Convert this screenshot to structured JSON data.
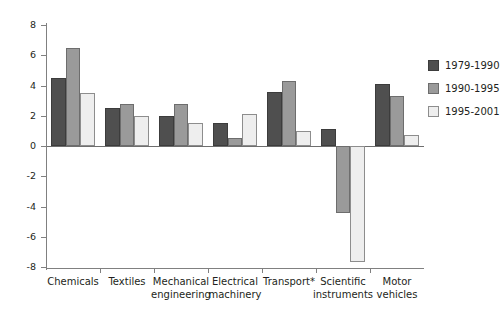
{
  "chart_data": {
    "type": "bar",
    "title": "",
    "subtitle": "",
    "xlabel": "",
    "ylabel": "",
    "ylim": [
      -8,
      8
    ],
    "ytick_labels": [
      "8",
      "6",
      "4",
      "2",
      "0",
      "-2",
      "-4",
      "-6",
      "-8"
    ],
    "ytick_values": [
      8,
      6,
      4,
      2,
      0,
      -2,
      -4,
      -6,
      -8
    ],
    "grid": false,
    "legend_position": "right",
    "categories": [
      "Chemicals",
      "Textiles",
      "Mechanical\nengineering",
      "Electrical\nmachinery",
      "Transport*",
      "Scientific\ninstruments",
      "Motor\nvehicles"
    ],
    "series": [
      {
        "name": "1979-1990",
        "color": "#4f4f4f",
        "values": [
          4.5,
          2.5,
          2.0,
          1.5,
          3.6,
          1.1,
          4.1
        ]
      },
      {
        "name": "1990-1995",
        "color": "#9a9a9a",
        "values": [
          6.5,
          2.8,
          2.8,
          0.5,
          4.3,
          -4.4,
          3.3
        ]
      },
      {
        "name": "1995-2001",
        "color": "#eeeeee",
        "values": [
          3.5,
          2.0,
          1.5,
          2.1,
          1.0,
          -7.7,
          0.7
        ]
      }
    ],
    "annotations": [
      "* Transport category marked with asterisk footnote"
    ]
  },
  "legend": {
    "items": [
      {
        "label": "1979-1990"
      },
      {
        "label": "1990-1995"
      },
      {
        "label": "1995-2001"
      }
    ]
  },
  "axis": {
    "y_ticks": [
      {
        "label": "8"
      },
      {
        "label": "6"
      },
      {
        "label": "4"
      },
      {
        "label": "2"
      },
      {
        "label": "0"
      },
      {
        "label": "-2"
      },
      {
        "label": "-4"
      },
      {
        "label": "-6"
      },
      {
        "label": "-8"
      }
    ]
  }
}
